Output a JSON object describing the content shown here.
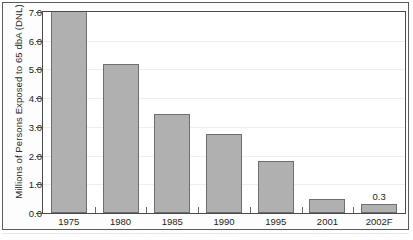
{
  "chart_data": {
    "type": "bar",
    "title": "",
    "xlabel": "",
    "ylabel": "Millions of Persons Exposed to 65 dbA (DNL)",
    "categories": [
      "1975",
      "1980",
      "1985",
      "1990",
      "1995",
      "2001",
      "2002F"
    ],
    "values": [
      7.0,
      5.2,
      3.45,
      2.75,
      1.8,
      0.5,
      0.3
    ],
    "point_labels": [
      "",
      "",
      "",
      "",
      "",
      "",
      "0.3"
    ],
    "ylim": [
      0.0,
      7.0
    ],
    "ytick_labels": [
      "0.0",
      "1.0",
      "2.0",
      "3.0",
      "4.0",
      "5.0",
      "6.0",
      "7.0"
    ],
    "ytick_values": [
      0.0,
      1.0,
      2.0,
      3.0,
      4.0,
      5.0,
      6.0,
      7.0
    ],
    "grid": true,
    "legend": false,
    "bar_color": "#b0b0b0",
    "bar_edge_color": "#6e6e6e",
    "axis_color": "#4a4a4a",
    "gridline_color": "#efeef0",
    "note": "first bar is clipped at the top of the axis"
  }
}
